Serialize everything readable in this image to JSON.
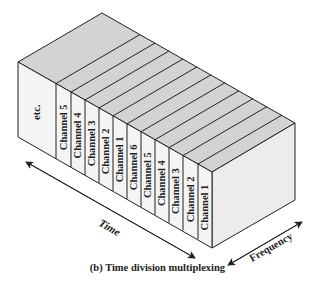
{
  "figure": {
    "caption": "(b) Time division multiplexing",
    "box_slots": [
      "etc.",
      "Channel 5",
      "Channel 4",
      "Channel 3",
      "Channel 2",
      "Channel 1",
      "Channel 6",
      "Channel 5",
      "Channel 4",
      "Channel 3",
      "Channel 2",
      "Channel 1"
    ],
    "axes": {
      "time_label": "Time",
      "frequency_label": "Frequency"
    },
    "colors": {
      "top_face": "#d3d3d3",
      "front_face": "#f4f4f4",
      "side_face": "#ececec",
      "stroke": "#222222"
    }
  }
}
